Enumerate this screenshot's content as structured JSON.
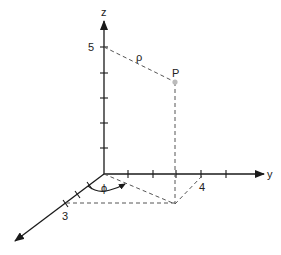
{
  "diagram": {
    "type": "cylindrical-coordinates-3d",
    "axes": {
      "x": {
        "label": "",
        "tick_label": "3"
      },
      "y": {
        "label": "y",
        "tick_label": "4"
      },
      "z": {
        "label": "z",
        "tick_label": "5"
      }
    },
    "point": {
      "label": "P",
      "color": "#bbbbbb"
    },
    "radius_label": "ρ",
    "angle_label": "ϕ",
    "colors": {
      "axis": "#1a1a1a",
      "dashed": "#555555",
      "text": "#222222"
    }
  }
}
